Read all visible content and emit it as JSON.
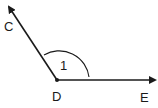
{
  "diagram": {
    "type": "angle",
    "vertex": {
      "label": "D"
    },
    "rays": [
      {
        "label": "C",
        "direction": "upper-left"
      },
      {
        "label": "E",
        "direction": "right"
      }
    ],
    "angle_label": "1",
    "colors": {
      "stroke": "#1a1a1a",
      "background": "#ffffff"
    }
  }
}
